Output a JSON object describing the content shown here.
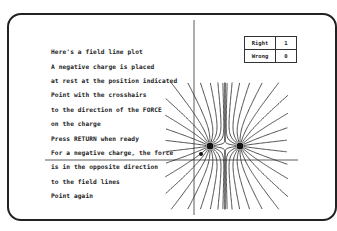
{
  "message": {
    "lines": [
      "Here's a field line plot",
      "A negative charge is placed",
      "at rest at the position indicated",
      "Point with the crosshairs",
      "to the direction of the FORCE",
      "on the charge",
      "Press RETURN when ready",
      "For a negative charge, the force",
      "is in the opposite direction",
      "to the field lines",
      "Point again"
    ]
  },
  "score": {
    "right_label": "Right",
    "right_value": "1",
    "wrong_label": "Wrong",
    "wrong_value": "0"
  },
  "plot": {
    "charges": [
      {
        "x": 210,
        "y": 146
      },
      {
        "x": 240,
        "y": 146
      }
    ],
    "test_charge": {
      "x": 201,
      "y": 154
    },
    "crosshair": {
      "x": 194,
      "y": 160
    }
  }
}
